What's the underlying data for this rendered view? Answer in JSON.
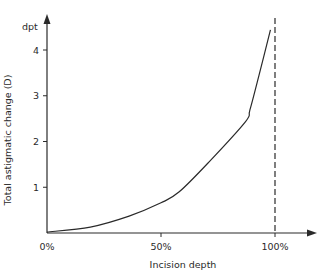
{
  "chart_data": {
    "type": "line",
    "title": "",
    "xlabel": "Incision depth",
    "ylabel": "Total astigmatic change (D)",
    "y_unit": "dpt",
    "x_ticks": [
      {
        "value": 0,
        "label": "0%"
      },
      {
        "value": 50,
        "label": "50%"
      },
      {
        "value": 100,
        "label": "100%"
      }
    ],
    "y_ticks": [
      {
        "value": 1,
        "label": "1"
      },
      {
        "value": 2,
        "label": "2"
      },
      {
        "value": 3,
        "label": "3"
      },
      {
        "value": 4,
        "label": "4"
      }
    ],
    "xlim": [
      0,
      105
    ],
    "ylim": [
      0,
      4.8
    ],
    "grid": false,
    "legend": null,
    "series": [
      {
        "name": "Total astigmatic change",
        "style": "solid",
        "x": [
          0,
          19,
          36,
          50,
          58,
          71,
          87,
          89,
          93,
          98
        ],
        "y": [
          0.02,
          0.13,
          0.37,
          0.66,
          0.9,
          1.55,
          2.43,
          2.69,
          3.45,
          4.44
        ]
      }
    ],
    "annotations": [
      {
        "type": "vertical-dashed-line",
        "x": 100,
        "description": "asymptote at 100% incision depth"
      }
    ]
  },
  "colors": {
    "line": "#2a2a2a",
    "background": "#ffffff"
  }
}
